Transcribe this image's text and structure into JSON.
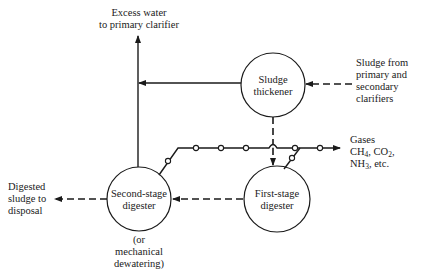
{
  "nodes": {
    "thickener": {
      "line1": "Sludge",
      "line2": "thickener"
    },
    "first_stage": {
      "line1": "First-stage",
      "line2": "digester"
    },
    "second_stage": {
      "line1": "Second-stage",
      "line2": "digester"
    }
  },
  "labels": {
    "excess_water": {
      "line1": "Excess water",
      "line2": "to primary clarifier"
    },
    "sludge_from": {
      "line1": "Sludge from",
      "line2": "primary and",
      "line3": "secondary",
      "line4": "clarifiers"
    },
    "gases": {
      "line1": "Gases",
      "ch": "CH",
      "ch_sub": "4",
      "co": ", CO",
      "co_sub": "2",
      "co_end": ",",
      "nh": "NH",
      "nh_sub": "3",
      "nh_end": ", etc."
    },
    "digested": {
      "line1": "Digested",
      "line2": "sludge to",
      "line3": "disposal"
    },
    "mechanical": {
      "line1": "(or",
      "line2": "mechanical",
      "line3": "dewatering)"
    }
  },
  "colors": {
    "line": "#1a1a1a",
    "background": "#ffffff"
  }
}
